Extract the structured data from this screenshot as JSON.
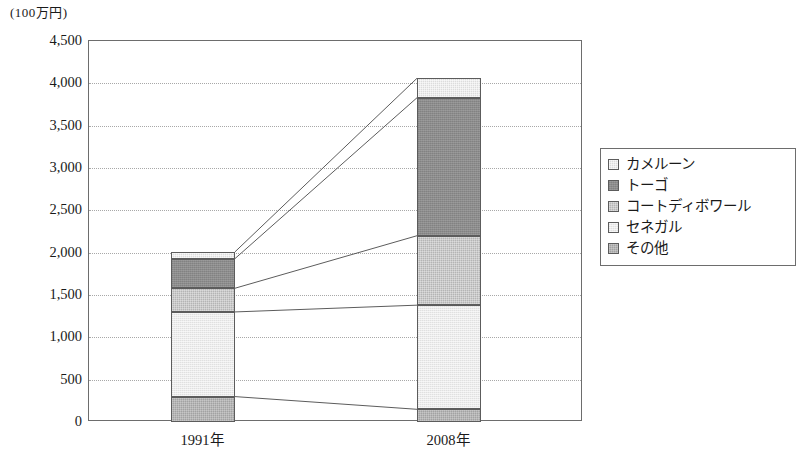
{
  "chart_data": {
    "type": "bar",
    "stacked": true,
    "title": "",
    "subtitle": "",
    "unit_label": "(100万円)",
    "xlabel": "",
    "ylabel": "",
    "categories": [
      "1991年",
      "2008年"
    ],
    "ylim": [
      0,
      4500
    ],
    "yticks": [
      "0",
      "500",
      "1,000",
      "1,500",
      "2,000",
      "2,500",
      "3,000",
      "3,500",
      "4,000",
      "4,500"
    ],
    "ytick_values": [
      0,
      500,
      1000,
      1500,
      2000,
      2500,
      3000,
      3500,
      4000,
      4500
    ],
    "grid": true,
    "grid_style": "dotted-horizontal",
    "legend_position": "right",
    "connectors": true,
    "stack_order_bottom_to_top": [
      "その他",
      "セネガル",
      "コートディボワール",
      "トーゴ",
      "カメルーン"
    ],
    "series": [
      {
        "name": "カメルーン",
        "values": [
          80,
          230
        ],
        "color": "#dcdcdc"
      },
      {
        "name": "トーゴ",
        "values": [
          350,
          1630
        ],
        "color": "#8c8c8c"
      },
      {
        "name": "コートディボワール",
        "values": [
          280,
          820
        ],
        "color": "#b4b4b4"
      },
      {
        "name": "セネガル",
        "values": [
          1000,
          1230
        ],
        "color": "#ececec"
      },
      {
        "name": "その他",
        "values": [
          300,
          150
        ],
        "color": "#a2a2a2"
      }
    ],
    "totals": [
      2010,
      4060
    ],
    "cumulative_tops": {
      "1991年": {
        "その他": 300,
        "セネガル": 1300,
        "コートディボワール": 1580,
        "トーゴ": 1930,
        "カメルーン": 2010
      },
      "2008年": {
        "その他": 150,
        "セネガル": 1380,
        "コートディボワール": 2200,
        "トーゴ": 3830,
        "カメルーン": 4060
      }
    }
  },
  "legend": {
    "items": [
      {
        "label": "カメルーン",
        "swatch": "cameroon"
      },
      {
        "label": "トーゴ",
        "swatch": "togo"
      },
      {
        "label": "コートディボワール",
        "swatch": "cote"
      },
      {
        "label": "セネガル",
        "swatch": "senegal"
      },
      {
        "label": "その他",
        "swatch": "other"
      }
    ]
  },
  "bottom_caption": ""
}
